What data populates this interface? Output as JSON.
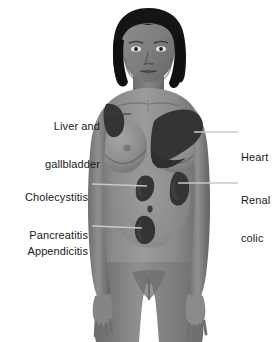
{
  "diagram": {
    "background_color": "#ffffff",
    "skin_color": "#8d8d8d",
    "skin_shadow_color": "#6e6e6e",
    "skin_highlight_color": "#a8a8a8",
    "hair_color": "#141414",
    "pain_region_color": "#3a3a3a",
    "label_text_color": "#1a1a1a",
    "leader_line_color": "#3c3c3c"
  },
  "labels": [
    {
      "id": "liver-gallbladder",
      "lines": [
        "Liver and",
        "gallbladder"
      ],
      "side": "left",
      "x": 18,
      "y": 95,
      "width": 82,
      "leader": {
        "x": 104,
        "y": 114,
        "length": 28
      }
    },
    {
      "id": "cholecystitis-pancreatitis",
      "lines": [
        "Cholecystitis",
        "Pancreatitis"
      ],
      "side": "left",
      "x": 10,
      "y": 166,
      "width": 78,
      "leader": {
        "x": 92,
        "y": 184,
        "length": 56
      }
    },
    {
      "id": "appendicitis",
      "lines": [
        "Appendicitis"
      ],
      "side": "left",
      "x": 12,
      "y": 220,
      "width": 76,
      "leader": {
        "x": 92,
        "y": 226,
        "length": 52
      }
    },
    {
      "id": "heart",
      "lines": [
        "Heart"
      ],
      "side": "right",
      "x": 240,
      "y": 126,
      "width": 40,
      "leader": {
        "x": 194,
        "y": 132,
        "length": 44
      }
    },
    {
      "id": "renal-colic",
      "lines": [
        "Renal",
        "colic"
      ],
      "side": "right",
      "x": 240,
      "y": 169,
      "width": 40,
      "leader": {
        "x": 186,
        "y": 182,
        "length": 52
      }
    }
  ],
  "pain_regions": [
    {
      "id": "liver-gallbladder-region",
      "name": "liver-and-gallbladder-shoulder-patch"
    },
    {
      "id": "heart-region",
      "name": "heart-chest-patch"
    },
    {
      "id": "cholecystitis-region",
      "name": "cholecystitis-pancreatitis-patch"
    },
    {
      "id": "renal-colic-region",
      "name": "renal-colic-flank-patch"
    },
    {
      "id": "appendicitis-region",
      "name": "appendicitis-lower-right-patch"
    }
  ],
  "figure": {
    "view": "front",
    "crop": "head-to-upper-thighs"
  }
}
